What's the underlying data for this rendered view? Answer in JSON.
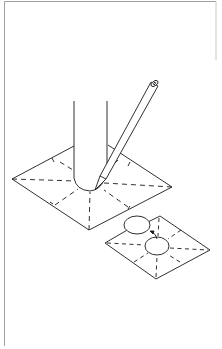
{
  "figure": {
    "colors": {
      "line": "#1a1a1a",
      "frame": "#9a9a9a",
      "background": "#ffffff"
    },
    "elements": {
      "frame": "border-frame",
      "pipe": "vertical-pipe",
      "pencil": "pencil-tool",
      "sheet_traced": "square-sheet-with-pipe",
      "sheet_cut": "square-sheet-with-cut-circle",
      "cutout": "circular-cutout-disc",
      "arrow": "removal-arrow"
    }
  }
}
